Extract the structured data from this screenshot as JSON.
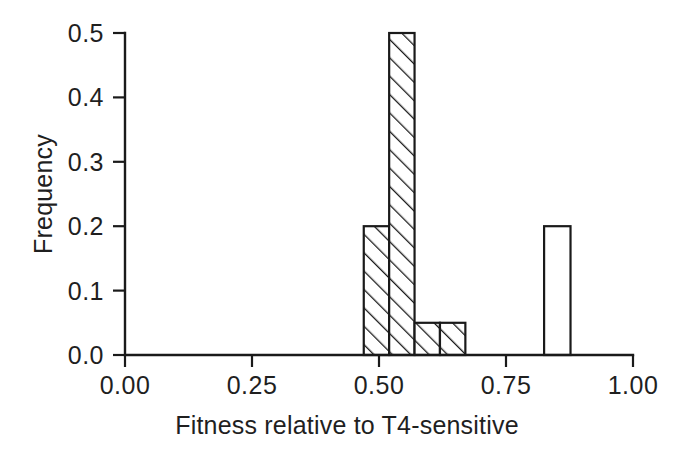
{
  "chart_data": {
    "type": "bar",
    "title": "",
    "subtitle": "",
    "xlabel": "Fitness relative to T4-sensitive",
    "ylabel": "Frequency",
    "xlim": [
      0.0,
      1.0
    ],
    "ylim": [
      0.0,
      0.5
    ],
    "grid": false,
    "legend": null,
    "x_tick_labels": [
      "0.00",
      "0.25",
      "0.50",
      "0.75",
      "1.00"
    ],
    "x_tick_values": [
      0.0,
      0.25,
      0.5,
      0.75,
      1.0
    ],
    "y_tick_labels": [
      "0.0",
      "0.1",
      "0.2",
      "0.3",
      "0.4",
      "0.5"
    ],
    "y_tick_values": [
      0.0,
      0.1,
      0.2,
      0.3,
      0.4,
      0.5
    ],
    "bin_width": 0.05,
    "bars": [
      {
        "name": "bin-0.50-0.55",
        "x0": 0.47,
        "x1": 0.52,
        "value": 0.2,
        "style": "hatched"
      },
      {
        "name": "bin-0.55-0.60",
        "x0": 0.52,
        "x1": 0.57,
        "value": 0.5,
        "style": "hatched"
      },
      {
        "name": "bin-0.60-0.65",
        "x0": 0.57,
        "x1": 0.62,
        "value": 0.05,
        "style": "hatched"
      },
      {
        "name": "bin-0.65-0.70",
        "x0": 0.62,
        "x1": 0.67,
        "value": 0.05,
        "style": "hatched"
      },
      {
        "name": "bin-0.82-0.87",
        "x0": 0.825,
        "x1": 0.877,
        "value": 0.2,
        "style": "open"
      }
    ],
    "categories": [
      "0.47-0.52",
      "0.52-0.57",
      "0.57-0.62",
      "0.62-0.67",
      "0.825-0.877"
    ],
    "values": [
      0.2,
      0.5,
      0.05,
      0.05,
      0.2
    ],
    "colors": {
      "axis": "#1a1a1a",
      "text": "#1f1f1f",
      "bar_fill": "#ffffff",
      "bar_stroke": "#1a1a1a",
      "hatch": "#1a1a1a",
      "background": "#ffffff"
    }
  },
  "axes": {
    "y_title": "Frequency",
    "x_title": "Fitness relative to T4-sensitive"
  }
}
